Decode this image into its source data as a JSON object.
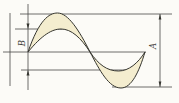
{
  "figure": {
    "type": "waveform-amplitude-diagram",
    "left_label": "B",
    "right_label": "A"
  },
  "colors": {
    "background": "#fcfbf7",
    "line": "#4a4a46",
    "wave_fill": "#f4edcf",
    "wave_stroke": "#35352f",
    "label_color": "#3a3a36"
  }
}
